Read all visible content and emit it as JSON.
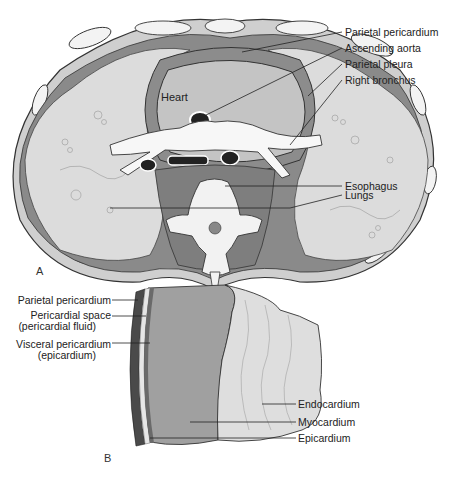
{
  "figure": {
    "panel_a": {
      "letter": "A",
      "heart_label": "Heart",
      "labels": [
        {
          "text": "Parietal pericardium"
        },
        {
          "text": "Ascending aorta"
        },
        {
          "text": "Parietal pleura"
        },
        {
          "text": "Right bronchus"
        },
        {
          "text": "Esophagus"
        },
        {
          "text": "Lungs"
        }
      ]
    },
    "panel_b": {
      "letter": "B",
      "left_labels": [
        {
          "line1": "Parietal pericardium",
          "line2": ""
        },
        {
          "line1": "Pericardial space",
          "line2": "(pericardial fluid)"
        },
        {
          "line1": "Visceral pericardium",
          "line2": "(epicardium)"
        }
      ],
      "right_labels": [
        {
          "text": "Endocardium"
        },
        {
          "text": "Myocardium"
        },
        {
          "text": "Epicardium"
        }
      ]
    },
    "colors": {
      "lung": "#d9d9d9",
      "pleura_dark": "#7a7a7a",
      "pericardium": "#8c8c8c",
      "heart": "#c8c8c8",
      "bone": "#f2f2f2",
      "outline": "#333333",
      "myocardium": "#9e9e9e",
      "endocardium": "#dcdcdc"
    }
  }
}
